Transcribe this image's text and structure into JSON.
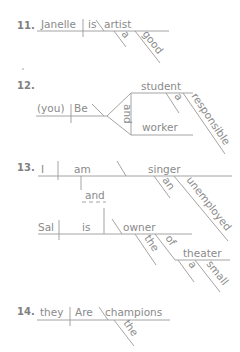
{
  "colors": {
    "text": "#8a8a8a",
    "number": "#808080",
    "line": "#9a9a9a",
    "background": "#ffffff"
  },
  "diagrams": [
    {
      "number": "11.",
      "words": {
        "subject": "Janelle",
        "verb": "is",
        "complement": "artist",
        "mod1": "a",
        "mod2": "good"
      }
    },
    {
      "number": "12.",
      "words": {
        "subject": "(you)",
        "verb": "Be",
        "conjunction": "and",
        "complement1": "student",
        "complement2": "worker",
        "mod1": "a",
        "mod2": "responsible"
      }
    },
    {
      "number": "13.",
      "words": {
        "subject1": "I",
        "verb1": "am",
        "complement1": "singer",
        "mod1a": "an",
        "mod1b": "unemployed",
        "conjunction": "and",
        "subject2": "Sal",
        "verb2": "is",
        "complement2": "owner",
        "mod2a": "the",
        "preposition": "of",
        "object": "theater",
        "mod3a": "a",
        "mod3b": "small"
      }
    },
    {
      "number": "14.",
      "words": {
        "subject": "they",
        "verb": "Are",
        "complement": "champions",
        "mod1": "the"
      }
    }
  ]
}
